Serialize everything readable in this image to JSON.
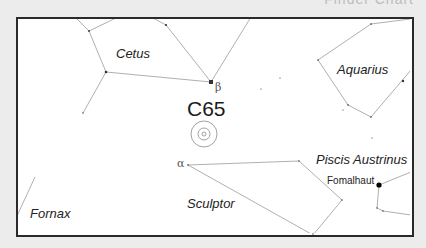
{
  "header": {
    "title": "Finder Chart"
  },
  "chart": {
    "target": {
      "label": "C65",
      "center": [
        204,
        134
      ],
      "rings": [
        13,
        6,
        2
      ]
    },
    "constellations": [
      {
        "name": "Cetus"
      },
      {
        "name": "Aquarius"
      },
      {
        "name": "Piscis Austrinus"
      },
      {
        "name": "Sculptor"
      },
      {
        "name": "Fornax"
      }
    ],
    "star_labels": {
      "beta": "β",
      "alpha": "α",
      "fomalhaut": "Fomalhaut"
    },
    "colors": {
      "background": "#ececec",
      "frame_fill": "#ffffff",
      "frame_border": "#2a2a2a",
      "lines": "#9a9a9a",
      "stars": "#333333"
    }
  }
}
